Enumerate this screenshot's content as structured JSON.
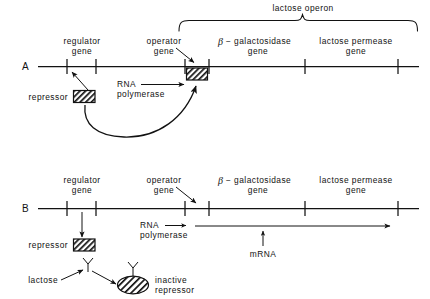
{
  "figure": {
    "title_bracket_label": "lactose operon",
    "panels": [
      {
        "id": "A",
        "panel_label": "A",
        "state": "repressed",
        "gene_labels": [
          {
            "name": "regulator-gene",
            "line1": "regulator",
            "line2": "gene"
          },
          {
            "name": "operator-gene",
            "line1": "operator",
            "line2": "gene"
          },
          {
            "name": "beta-galactosidase-gene",
            "line1_beta": "β",
            "line1": "− galactosidase",
            "line2": "gene"
          },
          {
            "name": "lactose-permease-gene",
            "line1": "lactose permease",
            "line2": "gene"
          }
        ],
        "repressor_label": "repressor",
        "rna_polymerase_label_line1": "RNA",
        "rna_polymerase_label_line2": "polymerase",
        "notes": "repressor protein binds operator gene, blocking RNA polymerase"
      },
      {
        "id": "B",
        "panel_label": "B",
        "state": "induced",
        "gene_labels": [
          {
            "name": "regulator-gene",
            "line1": "regulator",
            "line2": "gene"
          },
          {
            "name": "operator-gene",
            "line1": "operator",
            "line2": "gene"
          },
          {
            "name": "beta-galactosidase-gene",
            "line1_beta": "β",
            "line1": "− galactosidase",
            "line2": "gene"
          },
          {
            "name": "lactose-permease-gene",
            "line1": "lactose permease",
            "line2": "gene"
          }
        ],
        "repressor_label": "repressor",
        "rna_polymerase_label_line1": "RNA",
        "rna_polymerase_label_line2": "polymerase",
        "mrna_label": "mRNA",
        "lactose_label": "lactose",
        "inactive_repressor_label_line1": "inactive",
        "inactive_repressor_label_line2": "repressor"
      }
    ],
    "colors": {
      "ink": "#121212",
      "background": "#ffffff",
      "hatch": "#121212"
    }
  }
}
